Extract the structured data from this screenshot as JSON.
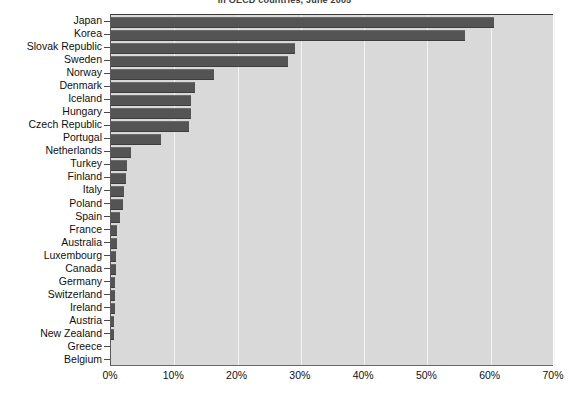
{
  "chart_data": {
    "type": "bar",
    "orientation": "horizontal",
    "title": "in OECD countries, June 2005",
    "xlabel": "",
    "ylabel": "",
    "xlim": [
      0,
      70
    ],
    "xtick_labels": [
      "0%",
      "10%",
      "20%",
      "30%",
      "40%",
      "50%",
      "60%",
      "70%"
    ],
    "xtick_values": [
      0,
      10,
      20,
      30,
      40,
      50,
      60,
      70
    ],
    "grid": true,
    "legend": "none",
    "bar_color": "#545454",
    "plot_background": "#d9d9d9",
    "gridline_color": "#f2f2f2",
    "categories": [
      "Japan",
      "Korea",
      "Slovak Republic",
      "Sweden",
      "Norway",
      "Denmark",
      "Iceland",
      "Hungary",
      "Czech Republic",
      "Portugal",
      "Netherlands",
      "Turkey",
      "Finland",
      "Italy",
      "Poland",
      "Spain",
      "France",
      "Australia",
      "Luxembourg",
      "Canada",
      "Germany",
      "Switzerland",
      "Ireland",
      "Austria",
      "New Zealand",
      "Greece",
      "Belgium"
    ],
    "values": [
      60.5,
      56.0,
      29.0,
      27.9,
      16.2,
      13.2,
      12.7,
      12.7,
      12.4,
      7.9,
      3.2,
      2.6,
      2.3,
      2.1,
      1.9,
      1.4,
      1.0,
      0.9,
      0.8,
      0.8,
      0.7,
      0.7,
      0.6,
      0.5,
      0.4,
      0.0,
      0.0
    ]
  }
}
